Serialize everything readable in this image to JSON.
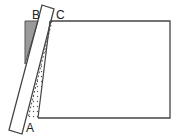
{
  "diagram": {
    "type": "geometry-folding-figure",
    "labels": {
      "a": "A",
      "b": "B",
      "c": "C"
    },
    "colors": {
      "stroke": "#444444",
      "shaded_triangle": "#9a9a9a",
      "dots": "#555555",
      "background": "#ffffff"
    },
    "shapes": {
      "rectangle": "main rectangle",
      "strip": "tilted strip (folded flap)",
      "shaded_triangle": "grey triangle at top-left",
      "dotted_region": "dotted sliver along fold line AC"
    }
  }
}
